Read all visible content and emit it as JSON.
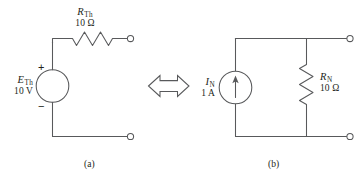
{
  "figure": {
    "background_color": "#ffffff",
    "line_color": "#58595b",
    "text_color": "#231f20",
    "equivalence_symbol": "double-headed-arrow"
  },
  "thevenin_circuit": {
    "caption": "(a)",
    "source": {
      "symbol": "E",
      "subscript": "Th",
      "value": "10 V",
      "plus_sign": "+",
      "minus_sign": "−",
      "type": "voltage-source"
    },
    "resistor": {
      "symbol": "R",
      "subscript": "Th",
      "value": "10 Ω",
      "orientation": "horizontal"
    },
    "terminals": [
      "top-right-terminal",
      "bottom-right-terminal"
    ]
  },
  "norton_circuit": {
    "caption": "(b)",
    "source": {
      "symbol": "I",
      "subscript": "N",
      "value": "1 A",
      "type": "current-source",
      "arrow_direction": "up"
    },
    "resistor": {
      "symbol": "R",
      "subscript": "N",
      "value": "10 Ω",
      "orientation": "vertical"
    },
    "terminals": [
      "top-right-terminal",
      "bottom-right-terminal"
    ]
  }
}
